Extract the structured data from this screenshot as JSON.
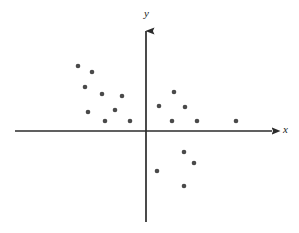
{
  "figure": {
    "title": "",
    "background_color": "#ffffff",
    "width": 299,
    "height": 233
  },
  "axes": {
    "x_label": "x",
    "y_label": "y",
    "axis_color": "#2b2b2b",
    "x_axis": {
      "name": "horizontal-axis",
      "start_px": 15,
      "end_px": 280,
      "y_px": 131,
      "arrow": "right"
    },
    "y_axis": {
      "name": "vertical-axis",
      "x_px": 146,
      "top_px": 22,
      "bottom_px": 222,
      "arrow": "up"
    }
  },
  "chart_data": {
    "type": "scatter",
    "title": "",
    "xlabel": "x",
    "ylabel": "y",
    "grid": false,
    "legend": null,
    "axis_style": "cartesian-arrows",
    "marker": {
      "shape": "circle",
      "color": "#4a4a4a",
      "radius_px": 2.3,
      "count": 20
    },
    "origin_px": {
      "x": 146,
      "y": 131
    },
    "xlim": [
      -146,
      153
    ],
    "ylim": [
      -102,
      109
    ],
    "note": "Points given in pixel coordinates of the source image; x/y are values relative to the origin in pixel units.",
    "points_px": [
      {
        "px": 78,
        "py": 66
      },
      {
        "px": 92,
        "py": 72
      },
      {
        "px": 85,
        "py": 87
      },
      {
        "px": 102,
        "py": 94
      },
      {
        "px": 122,
        "py": 96
      },
      {
        "px": 115,
        "py": 110
      },
      {
        "px": 88,
        "py": 112
      },
      {
        "px": 105,
        "py": 121
      },
      {
        "px": 130,
        "py": 121
      },
      {
        "px": 174,
        "py": 92
      },
      {
        "px": 159,
        "py": 106
      },
      {
        "px": 185,
        "py": 107
      },
      {
        "px": 172,
        "py": 121
      },
      {
        "px": 197,
        "py": 121
      },
      {
        "px": 236,
        "py": 121
      },
      {
        "px": 184,
        "py": 152
      },
      {
        "px": 194,
        "py": 163
      },
      {
        "px": 157,
        "py": 171
      },
      {
        "px": 184,
        "py": 186
      }
    ],
    "x": [
      -68,
      -54,
      -61,
      -44,
      -24,
      -31,
      -58,
      -41,
      -16,
      28,
      13,
      39,
      26,
      51,
      90,
      38,
      48,
      11,
      38
    ],
    "y": [
      65,
      59,
      44,
      37,
      35,
      21,
      19,
      10,
      10,
      39,
      25,
      24,
      10,
      10,
      10,
      -21,
      -32,
      -40,
      -55
    ],
    "quadrant_counts": {
      "upper_left": 9,
      "upper_right": 6,
      "lower_right": 4,
      "lower_left": 0
    }
  }
}
